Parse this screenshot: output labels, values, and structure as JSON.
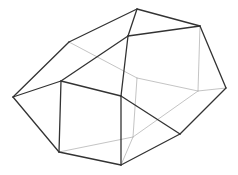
{
  "diagram": {
    "type": "wireframe-polyhedron",
    "background": "#ffffff",
    "colors": {
      "front_edge": "#333333",
      "back_edge": "#b5b5b5"
    },
    "vertices": {
      "A": [
        137,
        9
      ],
      "B": [
        200,
        26
      ],
      "C": [
        128,
        36
      ],
      "D": [
        69,
        42
      ],
      "E": [
        13,
        97
      ],
      "F": [
        61,
        81
      ],
      "G": [
        121,
        96
      ],
      "H": [
        226,
        88
      ],
      "I": [
        198,
        91
      ],
      "J": [
        137,
        78
      ],
      "K": [
        180,
        134
      ],
      "L": [
        59,
        152
      ],
      "M": [
        121,
        165
      ],
      "N": [
        133,
        137
      ]
    },
    "front_edges": [
      [
        "A",
        "B"
      ],
      [
        "A",
        "D"
      ],
      [
        "A",
        "C"
      ],
      [
        "C",
        "B"
      ],
      [
        "D",
        "E"
      ],
      [
        "C",
        "F"
      ],
      [
        "E",
        "F"
      ],
      [
        "E",
        "L"
      ],
      [
        "F",
        "L"
      ],
      [
        "F",
        "G"
      ],
      [
        "C",
        "G"
      ],
      [
        "G",
        "M"
      ],
      [
        "L",
        "M"
      ],
      [
        "G",
        "K"
      ],
      [
        "K",
        "H"
      ],
      [
        "B",
        "H"
      ],
      [
        "K",
        "M"
      ]
    ],
    "back_edges": [
      [
        "D",
        "J"
      ],
      [
        "J",
        "I"
      ],
      [
        "I",
        "H"
      ],
      [
        "B",
        "I"
      ],
      [
        "J",
        "N"
      ],
      [
        "I",
        "N"
      ],
      [
        "L",
        "N"
      ],
      [
        "N",
        "M"
      ]
    ]
  }
}
